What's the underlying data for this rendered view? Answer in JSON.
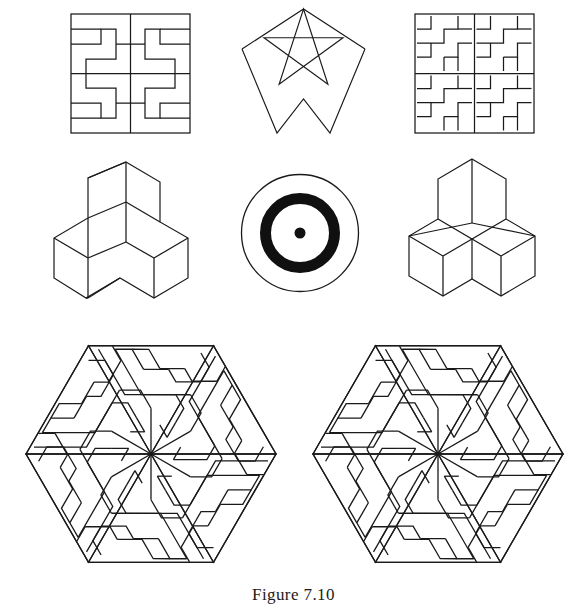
{
  "page": {
    "caption": "Figure 7.10",
    "background_color": "#ffffff",
    "ink_color": "#1a1a1a",
    "width": 587,
    "height": 602
  },
  "figures": [
    {
      "id": "square-meander-quadrant",
      "name": "square-meander-quadrant",
      "position": "top-left",
      "description": "Square frame containing four-fold rotational Greek-key meander",
      "bbox": {
        "x": 71,
        "y": 14,
        "width": 119,
        "height": 119
      }
    },
    {
      "id": "pentagram-star",
      "name": "pentagram-star",
      "position": "top-center",
      "description": "Five-pointed star outline drawn as a continuous pentagram",
      "bbox": {
        "x": 242,
        "y": 8,
        "width": 123,
        "height": 125
      }
    },
    {
      "id": "square-meander-four-tiles",
      "name": "square-meander-four-tiles",
      "position": "top-right",
      "description": "Square divided into four quadrants, each holding the same key meander tile",
      "bbox": {
        "x": 415,
        "y": 14,
        "width": 119,
        "height": 119
      }
    },
    {
      "id": "isometric-tripod-left",
      "name": "isometric-tripod-left",
      "position": "middle-left",
      "description": "Isometric three-armed block seen from above-left",
      "bbox": {
        "x": 70,
        "y": 162,
        "width": 118,
        "height": 126
      }
    },
    {
      "id": "concentric-target",
      "name": "concentric-target",
      "position": "middle-center",
      "description": "Thin outer circle, heavy black annulus and a small solid centre dot",
      "bbox": {
        "x": 241,
        "y": 174,
        "width": 118,
        "height": 118
      }
    },
    {
      "id": "isometric-tripod-right",
      "name": "isometric-tripod-right",
      "position": "middle-right",
      "description": "Symmetric isometric three-armed block seen from directly above",
      "bbox": {
        "x": 410,
        "y": 157,
        "width": 125,
        "height": 130
      }
    },
    {
      "id": "hexagon-meander-left",
      "name": "hexagon-meander-left",
      "position": "bottom-left",
      "description": "Hexagon of six triangular meander sectors in six-fold rotation",
      "bbox": {
        "x": 25,
        "y": 345,
        "width": 250,
        "height": 220
      }
    },
    {
      "id": "hexagon-meander-right",
      "name": "hexagon-meander-right",
      "position": "bottom-right",
      "description": "Hexagon of six triangular meander sectors in six-fold rotation",
      "bbox": {
        "x": 312,
        "y": 345,
        "width": 250,
        "height": 220
      }
    }
  ]
}
